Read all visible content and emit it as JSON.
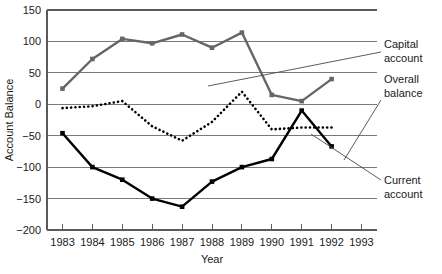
{
  "chart_data": {
    "type": "line",
    "title": "",
    "xlabel": "Year",
    "ylabel": "Account Balance",
    "categories": [
      "1983",
      "1984",
      "1985",
      "1986",
      "1987",
      "1988",
      "1989",
      "1990",
      "1991",
      "1992",
      "1993"
    ],
    "x_tick_labels": [
      "1983",
      "1984",
      "1985",
      "1986",
      "1987",
      "1988",
      "1989",
      "1990",
      "1991",
      "1992",
      "1993"
    ],
    "y_tick_labels": [
      "150",
      "100",
      "50",
      "0",
      "−50",
      "−100",
      "−150",
      "−200"
    ],
    "y_ticks": [
      150,
      100,
      50,
      0,
      -50,
      -100,
      -150,
      -200
    ],
    "ylim": [
      -200,
      150
    ],
    "xlim": [
      "1983",
      "1993"
    ],
    "grid": true,
    "legend_position": "annotations-right",
    "series": [
      {
        "name": "Capital account",
        "x": [
          "1983",
          "1984",
          "1985",
          "1986",
          "1987",
          "1988",
          "1989",
          "1990",
          "1991",
          "1992"
        ],
        "values": [
          25,
          72,
          104,
          97,
          111,
          90,
          114,
          15,
          5,
          40
        ],
        "color": "#666666",
        "style": "solid",
        "marker": "square"
      },
      {
        "name": "Overall balance",
        "x": [
          "1983",
          "1984",
          "1985",
          "1986",
          "1987",
          "1988",
          "1989",
          "1990",
          "1991",
          "1992"
        ],
        "values": [
          -6,
          -3,
          5,
          -35,
          -58,
          -28,
          20,
          -40,
          -37,
          -37
        ],
        "color": "#000000",
        "style": "dotted",
        "marker": "none"
      },
      {
        "name": "Current account",
        "x": [
          "1983",
          "1984",
          "1985",
          "1986",
          "1987",
          "1988",
          "1989",
          "1990",
          "1991",
          "1992"
        ],
        "values": [
          -46,
          -100,
          -120,
          -150,
          -163,
          -123,
          -100,
          -87,
          -10,
          -67
        ],
        "color": "#000000",
        "style": "solid",
        "marker": "square"
      }
    ],
    "annotations": [
      {
        "id": "capital",
        "line1": "Capital",
        "line2": "account"
      },
      {
        "id": "overall",
        "line1": "Overall",
        "line2": "balance"
      },
      {
        "id": "current",
        "line1": "Current",
        "line2": "account"
      }
    ]
  }
}
